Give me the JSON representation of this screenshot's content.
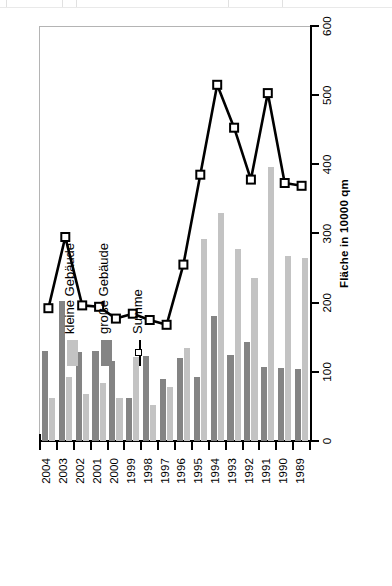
{
  "chart_data": {
    "type": "bar",
    "title": "",
    "xlabel": "",
    "ylabel": "Fläche in 10000 qm",
    "ylim": [
      0,
      600
    ],
    "ytick_step": 100,
    "yticks": [
      "0",
      "100",
      "200",
      "300",
      "400",
      "500",
      "600"
    ],
    "grid": false,
    "orientation": "rotated-90-ccw",
    "legend_position": "upper-left",
    "categories": [
      "1989",
      "1990",
      "1991",
      "1992",
      "1993",
      "1994",
      "1995",
      "1996",
      "1997",
      "1998",
      "1999",
      "2000",
      "2001",
      "2002",
      "2003",
      "2004"
    ],
    "series": [
      {
        "name": "kleine Gebäude",
        "color": "#c3c3c3",
        "values": [
          265,
          268,
          396,
          235,
          278,
          330,
          292,
          135,
          78,
          52,
          122,
          62,
          84,
          68,
          92,
          62
        ]
      },
      {
        "name": "große Gebäude",
        "color": "#848484",
        "values": [
          104,
          105,
          107,
          143,
          125,
          180,
          93,
          120,
          90,
          123,
          62,
          115,
          130,
          128,
          203,
          130
        ]
      },
      {
        "name": "Summe",
        "color": "#000000",
        "marker": "square-open",
        "values": [
          369,
          373,
          503,
          378,
          453,
          515,
          385,
          255,
          168,
          175,
          184,
          177,
          194,
          196,
          295,
          192
        ]
      }
    ],
    "legend_entries": [
      "kleine Gebäude",
      "große Gebäude",
      "Summe"
    ]
  },
  "axis": {
    "value_axis_title": "Fläche in 10000 qm",
    "value_max": 600,
    "value_min": 0
  },
  "legend": {
    "items": [
      {
        "label": "kleine Gebäude",
        "type": "swatch-small"
      },
      {
        "label": "große Gebäude",
        "type": "swatch-large"
      },
      {
        "label": "Summe",
        "type": "line-marker"
      }
    ]
  }
}
